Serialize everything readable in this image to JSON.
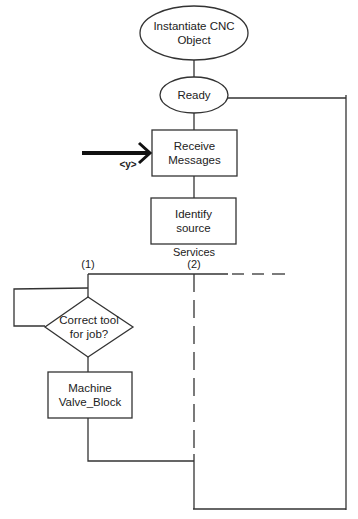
{
  "diagram": {
    "type": "flowchart",
    "nodes": {
      "start": {
        "shape": "ellipse",
        "line1": "Instantiate CNC",
        "line2": "Object"
      },
      "ready": {
        "shape": "ellipse",
        "label": "Ready"
      },
      "receive": {
        "shape": "rectangle",
        "line1": "Receive",
        "line2": "Messages"
      },
      "identify": {
        "shape": "rectangle",
        "line1": "Identify",
        "line2": "source"
      },
      "decision": {
        "shape": "diamond",
        "line1": "Correct tool",
        "line2": "for job?"
      },
      "machine": {
        "shape": "rectangle",
        "line1": "Machine",
        "line2": "Valve_Block"
      }
    },
    "labels": {
      "input_arrow": "<y>",
      "services": "Services",
      "branch1": "(1)",
      "branch2": "(2)"
    },
    "colors": {
      "stroke": "#333333",
      "background": "#ffffff"
    }
  }
}
